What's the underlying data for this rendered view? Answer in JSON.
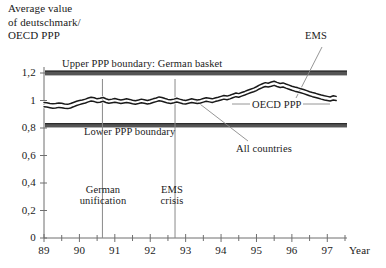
{
  "figure": {
    "y_axis_title": "Average value\nof deutschmark/\nOECD PPP",
    "x_axis_title": "Year"
  },
  "chart_data": {
    "type": "line",
    "xlabel": "Year",
    "ylabel": "Average value of deutschmark/OECD PPP",
    "xlim": [
      89,
      97.5
    ],
    "ylim": [
      0,
      1.28
    ],
    "grid": false,
    "legend_position": "inline-annotations",
    "ytick_labels": [
      "0",
      "0,2",
      "0,4",
      "0,6",
      "0,8",
      "1",
      "1,2"
    ],
    "ytick_values": [
      0,
      0.2,
      0.4,
      0.6,
      0.8,
      1.0,
      1.2
    ],
    "xtick_labels": [
      "89",
      "90",
      "91",
      "92",
      "93",
      "94",
      "95",
      "96",
      "97"
    ],
    "xtick_values": [
      89,
      90,
      91,
      92,
      93,
      94,
      95,
      96,
      97
    ],
    "xminor_step": 0.5,
    "bands": [
      {
        "name": "Upper PPP boundary: German basket",
        "value": 1.2,
        "thickness": 0.035,
        "color": "#555555"
      },
      {
        "name": "Lower PPP boundary",
        "value": 0.82,
        "thickness": 0.032,
        "color": "#555555"
      }
    ],
    "reference_lines": [
      {
        "name": "German unification",
        "x": 90.65,
        "label": "German\nunification"
      },
      {
        "name": "EMS crisis",
        "x": 92.7,
        "label": "EMS\ncrisis"
      }
    ],
    "annotations": [
      {
        "name": "upper-boundary-label",
        "text": "Upper PPP boundary: German basket"
      },
      {
        "name": "lower-boundary-label",
        "text": "Lower PPP boundary"
      },
      {
        "name": "ems-label",
        "text": "EMS"
      },
      {
        "name": "oecd-ppp-label",
        "text": "OECD PPP"
      },
      {
        "name": "all-countries-label",
        "text": "All countries"
      }
    ],
    "x": [
      89.0,
      89.08,
      89.17,
      89.25,
      89.33,
      89.42,
      89.5,
      89.58,
      89.67,
      89.75,
      89.83,
      89.92,
      90.0,
      90.08,
      90.17,
      90.25,
      90.33,
      90.42,
      90.5,
      90.58,
      90.67,
      90.75,
      90.83,
      90.92,
      91.0,
      91.08,
      91.17,
      91.25,
      91.33,
      91.42,
      91.5,
      91.58,
      91.67,
      91.75,
      91.83,
      91.92,
      92.0,
      92.08,
      92.17,
      92.25,
      92.33,
      92.42,
      92.5,
      92.58,
      92.67,
      92.75,
      92.83,
      92.92,
      93.0,
      93.08,
      93.17,
      93.25,
      93.33,
      93.42,
      93.5,
      93.58,
      93.67,
      93.75,
      93.83,
      93.92,
      94.0,
      94.08,
      94.17,
      94.25,
      94.33,
      94.42,
      94.5,
      94.58,
      94.67,
      94.75,
      94.83,
      94.92,
      95.0,
      95.08,
      95.17,
      95.25,
      95.33,
      95.42,
      95.5,
      95.58,
      95.67,
      95.75,
      95.83,
      95.92,
      96.0,
      96.08,
      96.17,
      96.25,
      96.33,
      96.42,
      96.5,
      96.58,
      96.67,
      96.75,
      96.83,
      96.92,
      97.0,
      97.08,
      97.17,
      97.25
    ],
    "series": [
      {
        "name": "EMS",
        "color": "#1a1a1a",
        "values": [
          0.985,
          0.983,
          0.979,
          0.976,
          0.978,
          0.982,
          0.98,
          0.975,
          0.972,
          0.978,
          0.986,
          0.995,
          1.0,
          1.004,
          1.01,
          1.018,
          1.024,
          1.02,
          1.012,
          1.016,
          1.022,
          1.013,
          1.006,
          1.01,
          1.014,
          1.009,
          1.004,
          1.008,
          1.012,
          1.008,
          1.002,
          0.998,
          1.004,
          1.01,
          1.006,
          1.0,
          1.005,
          1.012,
          1.018,
          1.026,
          1.022,
          1.014,
          1.008,
          1.005,
          1.01,
          1.016,
          1.01,
          1.004,
          1.0,
          1.006,
          1.012,
          1.008,
          1.004,
          1.008,
          1.014,
          1.02,
          1.016,
          1.012,
          1.018,
          1.024,
          1.03,
          1.036,
          1.032,
          1.038,
          1.046,
          1.054,
          1.05,
          1.058,
          1.066,
          1.074,
          1.082,
          1.09,
          1.1,
          1.112,
          1.122,
          1.13,
          1.126,
          1.134,
          1.14,
          1.132,
          1.124,
          1.128,
          1.12,
          1.112,
          1.104,
          1.098,
          1.092,
          1.086,
          1.08,
          1.072,
          1.064,
          1.058,
          1.052,
          1.046,
          1.04,
          1.034,
          1.03,
          1.026,
          1.034,
          1.03
        ]
      },
      {
        "name": "All countries",
        "color": "#1a1a1a",
        "values": [
          0.955,
          0.952,
          0.948,
          0.944,
          0.946,
          0.95,
          0.948,
          0.944,
          0.941,
          0.946,
          0.954,
          0.964,
          0.97,
          0.976,
          0.982,
          0.99,
          0.996,
          0.992,
          0.985,
          0.988,
          0.994,
          0.986,
          0.98,
          0.984,
          0.988,
          0.983,
          0.978,
          0.982,
          0.986,
          0.982,
          0.976,
          0.972,
          0.978,
          0.984,
          0.98,
          0.974,
          0.978,
          0.985,
          0.992,
          0.998,
          0.994,
          0.987,
          0.981,
          0.978,
          0.983,
          0.989,
          0.983,
          0.977,
          0.974,
          0.98,
          0.986,
          0.982,
          0.978,
          0.982,
          0.988,
          0.994,
          0.99,
          0.986,
          0.992,
          0.998,
          1.004,
          1.01,
          1.006,
          1.012,
          1.02,
          1.028,
          1.024,
          1.032,
          1.04,
          1.048,
          1.056,
          1.064,
          1.072,
          1.084,
          1.094,
          1.102,
          1.098,
          1.104,
          1.11,
          1.102,
          1.094,
          1.098,
          1.09,
          1.082,
          1.074,
          1.068,
          1.062,
          1.056,
          1.05,
          1.042,
          1.034,
          1.028,
          1.022,
          1.016,
          1.01,
          1.004,
          1.0,
          0.996,
          1.004,
          1.0
        ]
      }
    ]
  }
}
